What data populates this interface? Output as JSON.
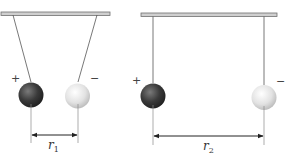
{
  "diagram": {
    "colors": {
      "bar_fill": "#cfcfcf",
      "bar_stroke": "#6f6f6f",
      "thread": "#555555",
      "guide_line": "#8a8a8a",
      "arrow": "#222222",
      "positive_sphere": "#3a3a3a",
      "negative_sphere": "#dedede"
    },
    "panels": [
      {
        "id": "close",
        "positive_sign": "+",
        "negative_sign": "−",
        "distance_label": "r",
        "distance_subscript": "1"
      },
      {
        "id": "far",
        "positive_sign": "+",
        "negative_sign": "−",
        "distance_label": "r",
        "distance_subscript": "2"
      }
    ]
  }
}
